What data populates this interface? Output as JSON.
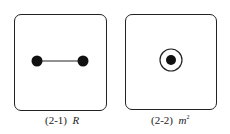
{
  "panels": [
    {
      "id": "2-1",
      "label": "(2-1)",
      "symbol": "R",
      "content": "two filled nodes connected by a horizontal line"
    },
    {
      "id": "2-2",
      "label": "(2-2)",
      "symbol": "m",
      "symbol_superscript": "2",
      "content": "filled node surrounded by a circle"
    }
  ],
  "colors": {
    "stroke": "#222222",
    "fill": "#111111",
    "background": "#ffffff"
  }
}
